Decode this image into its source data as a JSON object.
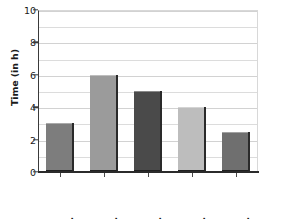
{
  "chart_data": {
    "type": "bar",
    "title": "",
    "xlabel": "",
    "ylabel": "Time (in h)",
    "categories": [
      "Mon.",
      "Tues.",
      "Wed.",
      "Thurs.",
      "Fri."
    ],
    "values": [
      3,
      6,
      5,
      4,
      2.5
    ],
    "bar_colors": [
      "#7d7d7d",
      "#9b9b9b",
      "#4a4a4a",
      "#bdbdbd",
      "#6f6f6f"
    ],
    "ylim": [
      0,
      10
    ],
    "y_ticks": [
      0,
      2,
      4,
      6,
      8,
      10
    ],
    "y_tick_labels": [
      "0",
      "2",
      "4",
      "6",
      "8",
      "10"
    ],
    "gridlines": [
      1,
      2,
      3,
      4,
      5,
      6,
      7,
      8,
      9,
      10
    ],
    "grid": true,
    "legend": "none",
    "axis_color": "#2b2b2b",
    "grid_color": "#dcdcdc",
    "background": "#ffffff"
  }
}
